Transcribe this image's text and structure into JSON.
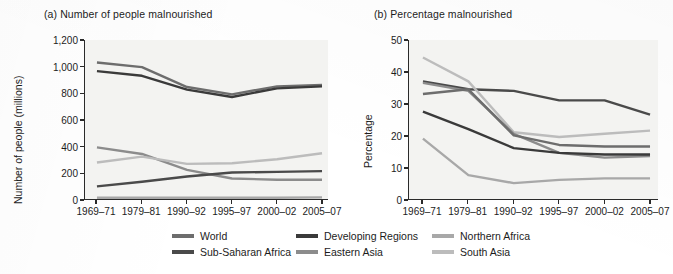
{
  "figure": {
    "panels": [
      {
        "key": "a",
        "title": "(a) Number of people malnourished",
        "ylabel": "Number of people (millions)"
      },
      {
        "key": "b",
        "title": "(b) Percentage malnourished",
        "ylabel": "Percentage"
      }
    ]
  },
  "legend": {
    "items": [
      {
        "label": "World",
        "color": "#6d6d6d"
      },
      {
        "label": "Developing Regions",
        "color": "#3a3a3a"
      },
      {
        "label": "Northern Africa",
        "color": "#a8a8a8"
      },
      {
        "label": "Sub-Saharan Africa",
        "color": "#4a4a4a"
      },
      {
        "label": "Eastern Asia",
        "color": "#8c8c8c"
      },
      {
        "label": "South Asia",
        "color": "#bcbcbc"
      }
    ]
  },
  "chart_data": [
    {
      "type": "line",
      "panel": "a",
      "title": "(a) Number of people malnourished",
      "xlabel": "",
      "ylabel": "Number of people (millions)",
      "categories": [
        "1969-71",
        "1979-81",
        "1990-92",
        "1995-97",
        "2000-02",
        "2005-07"
      ],
      "ylim": [
        0,
        1200
      ],
      "yticks": [
        0,
        200,
        400,
        600,
        800,
        1000,
        1200
      ],
      "ytick_labels": [
        "0",
        "200",
        "400",
        "600",
        "800",
        "1,000",
        "1,200"
      ],
      "grid": false,
      "legend_position": "below-figure",
      "series": [
        {
          "name": "World",
          "color": "#6d6d6d",
          "values": [
            1030,
            995,
            845,
            790,
            850,
            860
          ]
        },
        {
          "name": "Developing Regions",
          "color": "#3a3a3a",
          "values": [
            965,
            930,
            825,
            770,
            835,
            850
          ]
        },
        {
          "name": "Eastern Asia",
          "color": "#8c8c8c",
          "values": [
            390,
            340,
            220,
            155,
            145,
            145
          ]
        },
        {
          "name": "South Asia",
          "color": "#bcbcbc",
          "values": [
            275,
            320,
            265,
            270,
            300,
            345
          ]
        },
        {
          "name": "Sub-Saharan Africa",
          "color": "#4a4a4a",
          "values": [
            95,
            130,
            170,
            200,
            205,
            210
          ]
        },
        {
          "name": "Northern Africa",
          "color": "#a8a8a8",
          "values": [
            10,
            10,
            10,
            10,
            10,
            12
          ]
        }
      ]
    },
    {
      "type": "line",
      "panel": "b",
      "title": "(b) Percentage malnourished",
      "xlabel": "",
      "ylabel": "Percentage",
      "categories": [
        "1969-71",
        "1979-81",
        "1990-92",
        "1995-97",
        "2000-02",
        "2005-07"
      ],
      "ylim": [
        0,
        50
      ],
      "yticks": [
        0,
        10,
        20,
        30,
        40,
        50
      ],
      "ytick_labels": [
        "0",
        "10",
        "20",
        "30",
        "40",
        "50"
      ],
      "grid": false,
      "legend_position": "below-figure",
      "series": [
        {
          "name": "Sub-Saharan Africa",
          "color": "#4a4a4a",
          "values": [
            37,
            34.5,
            34,
            31,
            31,
            26.5
          ]
        },
        {
          "name": "South Asia",
          "color": "#bcbcbc",
          "values": [
            44.5,
            37,
            21,
            19.5,
            20.5,
            21.5
          ]
        },
        {
          "name": "Eastern Asia",
          "color": "#8c8c8c",
          "values": [
            36.5,
            34,
            20.5,
            14.5,
            13,
            13.5
          ]
        },
        {
          "name": "World",
          "color": "#6d6d6d",
          "values": [
            33,
            34.5,
            20,
            17,
            16.5,
            16.5
          ]
        },
        {
          "name": "Developing Regions",
          "color": "#3a3a3a",
          "values": [
            27.5,
            22,
            16,
            14.5,
            14,
            14
          ]
        },
        {
          "name": "Northern Africa",
          "color": "#a8a8a8",
          "values": [
            19,
            7.5,
            5,
            6,
            6.5,
            6.5
          ]
        }
      ]
    }
  ]
}
